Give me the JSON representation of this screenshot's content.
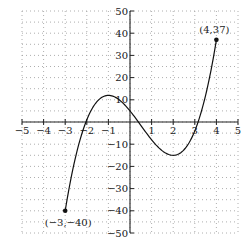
{
  "chart_data": {
    "type": "line",
    "title": "",
    "xlabel": "",
    "ylabel": "",
    "xlim": [
      -5,
      5
    ],
    "ylim": [
      -50,
      50
    ],
    "grid": true,
    "grid_style": "dotted",
    "x_ticks": [
      -5,
      -4,
      -3,
      -2,
      -1,
      1,
      2,
      3,
      4,
      5
    ],
    "x_tick_labels": [
      "−5",
      "−4",
      "−3",
      "−2",
      "−1",
      "1",
      "2",
      "3",
      "4",
      "5"
    ],
    "y_ticks": [
      50,
      40,
      30,
      20,
      10,
      -10,
      -20,
      -30,
      -40,
      -50
    ],
    "y_tick_labels": [
      "50",
      "40",
      "30",
      "20",
      "10",
      "−10",
      "−20",
      "−30",
      "−40",
      "−50"
    ],
    "series": [
      {
        "name": "f(x)",
        "domain": [
          -3,
          4
        ],
        "x": [
          -3,
          -2.5,
          -2,
          -1.5,
          -1,
          -0.5,
          0,
          0.5,
          1,
          1.5,
          2,
          2.5,
          3,
          3.5,
          4
        ],
        "y": [
          -40,
          -15,
          1,
          9.5,
          12,
          10,
          5,
          -1,
          -8,
          -13,
          -15,
          -12.5,
          -4,
          11.5,
          37
        ],
        "color": "#111111"
      }
    ],
    "annotations": [
      {
        "point": [
          4,
          37
        ],
        "label": "(4, 37)"
      },
      {
        "point": [
          -3,
          -40
        ],
        "label": "(−3, −40)"
      }
    ]
  },
  "labels": {
    "end_point_label": "(4,37)",
    "start_point_label": "(−3,−40)"
  }
}
